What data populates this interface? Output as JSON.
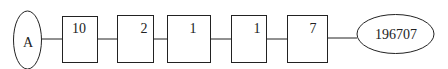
{
  "diagram": {
    "start_node": {
      "label": "A"
    },
    "boxes": [
      {
        "label": "10"
      },
      {
        "label": "2"
      },
      {
        "label": "1"
      },
      {
        "label": "1"
      },
      {
        "label": "7"
      }
    ],
    "end_node": {
      "label": "196707"
    },
    "colors": {
      "stroke": "#222222",
      "background": "#ffffff"
    }
  }
}
